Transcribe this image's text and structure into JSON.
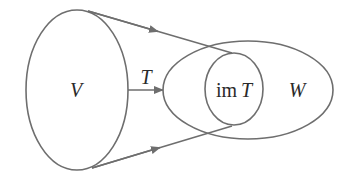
{
  "diagram": {
    "type": "set-mapping",
    "stroke_color": "#6e6e6e",
    "text_color": "#2a2a2a",
    "domain_set": {
      "label": "V"
    },
    "codomain_set": {
      "label": "W"
    },
    "image_set": {
      "label_prefix": "im",
      "label_var": "T"
    },
    "map": {
      "label": "T"
    }
  }
}
